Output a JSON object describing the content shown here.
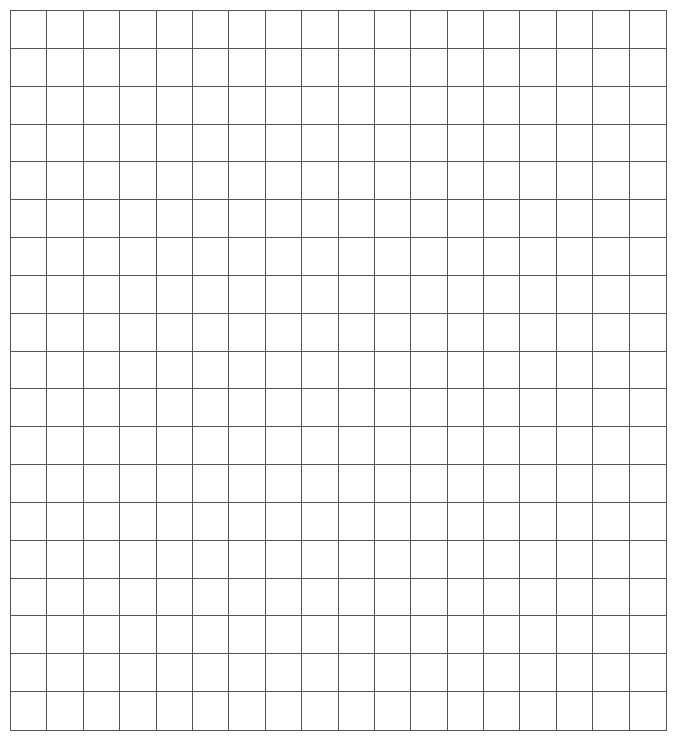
{
  "grid": {
    "columns": 18,
    "rows": 19,
    "line_color": "#555555",
    "background": "#ffffff",
    "cells_content": "empty"
  }
}
